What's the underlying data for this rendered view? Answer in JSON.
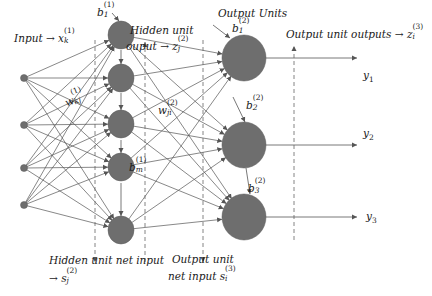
{
  "diagram": {
    "colors": {
      "node_fill": "#6e6e6e",
      "node_stroke": "#5a5a5a",
      "edge": "#555555",
      "dashed": "#666666",
      "text": "#1a1a1a"
    },
    "labels": {
      "input": {
        "text": "Input → x",
        "sub": "k",
        "sup": "(1)"
      },
      "hidden_output_line1": {
        "text": "Hidden unit"
      },
      "hidden_output_line2": {
        "text": "ouput → z",
        "sub": "j",
        "sup": "(2)"
      },
      "output_units": {
        "text": "Output Units"
      },
      "output_unit_outputs": {
        "text": "Output unit outputs → z",
        "sub": "i",
        "sup": "(3)"
      },
      "hidden_net_input_line1": {
        "text": "Hidden unit net input"
      },
      "hidden_net_input_line2": {
        "text": "→ s",
        "sub": "j",
        "sup": "(2)"
      },
      "output_net_input_line1": {
        "text": "Output unit"
      },
      "output_net_input_line2": {
        "text": "net input s",
        "sub": "i",
        "sup": "(3)"
      },
      "weight_1": {
        "text": "w",
        "sub": "kj",
        "sup": "(1)"
      },
      "weight_2": {
        "text": "w",
        "sub": "ji",
        "sup": "(2)"
      },
      "bias_hidden_1": {
        "text": "b",
        "sub": "1",
        "sup": "(1)"
      },
      "bias_hidden_m": {
        "text": "b",
        "sub": "m",
        "sup": "(1)"
      },
      "bias_out_1": {
        "text": "b",
        "sub": "1",
        "sup": "(2)"
      },
      "bias_out_2": {
        "text": "b",
        "sub": "2",
        "sup": "(2)"
      },
      "bias_out_3": {
        "text": "b",
        "sub": "3",
        "sup": "(2)"
      },
      "y1": {
        "text": "y",
        "sub": "1"
      },
      "y2": {
        "text": "y",
        "sub": "2"
      },
      "y3": {
        "text": "y",
        "sub": "3"
      }
    },
    "layers": {
      "input": [
        {
          "x": 24,
          "y": 78
        },
        {
          "x": 24,
          "y": 125
        },
        {
          "x": 24,
          "y": 168
        },
        {
          "x": 24,
          "y": 205
        }
      ],
      "hidden": [
        {
          "x": 121,
          "y": 35
        },
        {
          "x": 121,
          "y": 78
        },
        {
          "x": 121,
          "y": 124
        },
        {
          "x": 121,
          "y": 167
        },
        {
          "x": 121,
          "y": 230
        }
      ],
      "output": [
        {
          "x": 244,
          "y": 58
        },
        {
          "x": 244,
          "y": 145
        },
        {
          "x": 244,
          "y": 217
        }
      ]
    },
    "output_line_end_x": 357,
    "dashed_lines": [
      {
        "x": 95,
        "y1": 40,
        "y2": 262,
        "arrow": "down"
      },
      {
        "x": 145,
        "y1": 42,
        "y2": 262,
        "arrow": "up"
      },
      {
        "x": 203,
        "y1": 40,
        "y2": 262,
        "arrow": "down"
      },
      {
        "x": 294,
        "y1": 46,
        "y2": 240,
        "arrow": "up"
      }
    ]
  }
}
